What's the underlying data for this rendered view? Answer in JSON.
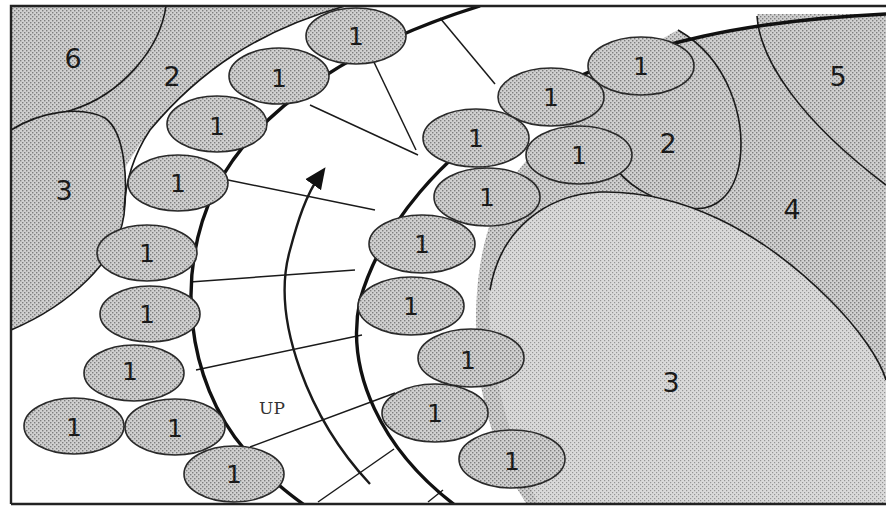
{
  "diagram": {
    "colors": {
      "background": "#ffffff",
      "stipple_fill": "#c8c8c8",
      "stipple_dot": "#8a8a8a",
      "line": "#1a1a1a"
    },
    "flow": {
      "label": "UP",
      "direction": "upward along the curved channel"
    },
    "regions": [
      {
        "id": "region-6-top-left",
        "label": "6"
      },
      {
        "id": "region-2-top-left",
        "label": "2"
      },
      {
        "id": "region-3-left",
        "label": "3"
      },
      {
        "id": "region-2-right",
        "label": "2"
      },
      {
        "id": "region-5-right",
        "label": "5"
      },
      {
        "id": "region-4-right",
        "label": "4"
      },
      {
        "id": "region-3-bottom-right",
        "label": "3"
      }
    ],
    "outer_wall_cells": [
      {
        "label": "1"
      },
      {
        "label": "1"
      },
      {
        "label": "1"
      },
      {
        "label": "1"
      },
      {
        "label": "1"
      },
      {
        "label": "1"
      },
      {
        "label": "1"
      },
      {
        "label": "1"
      },
      {
        "label": "1"
      },
      {
        "label": "1"
      }
    ],
    "inner_wall_cells": [
      {
        "label": "1"
      },
      {
        "label": "1"
      },
      {
        "label": "1"
      },
      {
        "label": "1"
      },
      {
        "label": "1"
      },
      {
        "label": "1"
      },
      {
        "label": "1"
      },
      {
        "label": "1"
      },
      {
        "label": "1"
      },
      {
        "label": "1"
      },
      {
        "label": "1"
      }
    ]
  }
}
